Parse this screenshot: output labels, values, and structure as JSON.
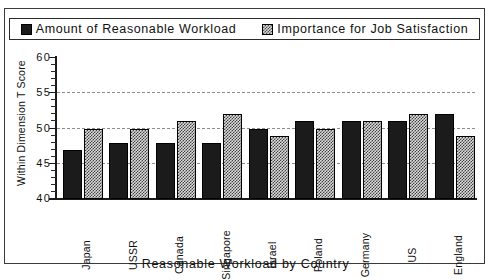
{
  "legend": {
    "entries": [
      {
        "label": "Amount of Reasonable Workload",
        "swatch": "solid-black-square-icon"
      },
      {
        "label": "Importance  for  Job  Satisfaction",
        "swatch": "hatched-square-icon"
      }
    ]
  },
  "axes": {
    "ylabel": "Within Dimension T Score",
    "xlabel": "Reasonable Workload by Country",
    "yticks": [
      "60",
      "55",
      "50",
      "45",
      "40"
    ]
  },
  "colors": {
    "series_a": "#1b1b1b",
    "series_b": "#dcdcdc",
    "axis": "#1a1a1a",
    "grid": "#8d8d8d",
    "frame": "#3a3a3a",
    "background": "#ffffff"
  },
  "chart_data": {
    "type": "bar",
    "title": "",
    "subtitle": "",
    "xlabel": "Reasonable Workload by Country",
    "ylabel": "Within Dimension T Score",
    "ylim": [
      40,
      60
    ],
    "yticks": [
      40,
      45,
      50,
      55,
      60
    ],
    "grid": true,
    "grid_axis": "y",
    "legend_position": "top",
    "categories": [
      "Japan",
      "USSR",
      "Canada",
      "Singapore",
      "Israel",
      "Poland",
      "Germany",
      "US",
      "England"
    ],
    "series": [
      {
        "name": "Amount of Reasonable Workload",
        "values": [
          47,
          48,
          48,
          48,
          50,
          51,
          51,
          51,
          52
        ]
      },
      {
        "name": "Importance for Job Satisfaction",
        "values": [
          50,
          50,
          51,
          52,
          49,
          50,
          51,
          52,
          49
        ]
      }
    ]
  }
}
